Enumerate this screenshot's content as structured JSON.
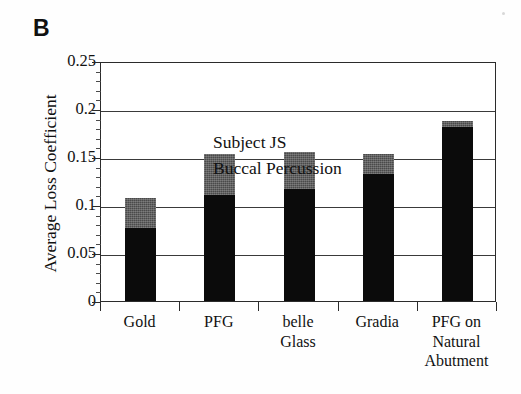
{
  "panel": {
    "letter": "B"
  },
  "annotation": {
    "lines": [
      "Subject JS",
      "Buccal Percussion"
    ]
  },
  "axes": {
    "ylabel": "Average Loss Coefficient",
    "yticks": [
      "0.25",
      "0.2",
      "0.15",
      "0.1",
      "0.05",
      "0"
    ],
    "xlabel": ""
  },
  "xlabels": [
    {
      "lines": [
        "Gold"
      ]
    },
    {
      "lines": [
        "PFG"
      ]
    },
    {
      "lines": [
        "belle",
        "Glass"
      ]
    },
    {
      "lines": [
        "Gradia"
      ]
    },
    {
      "lines": [
        "PFG on",
        "Natural",
        "Abutment"
      ]
    }
  ],
  "colors": {
    "lower_segment": "#0b0b0b",
    "upper_segment": "#4a4a4a",
    "axis": "#2b2b2b",
    "background": "#ffffff"
  },
  "chart_data": {
    "type": "bar",
    "title": "B",
    "subtitle": "Subject JS / Buccal Percussion",
    "xlabel": "",
    "ylabel": "Average Loss Coefficient",
    "ylim": [
      0,
      0.25
    ],
    "ytick_values": [
      0,
      0.05,
      0.1,
      0.15,
      0.2,
      0.25
    ],
    "grid": true,
    "grid_axis": "y",
    "legend": false,
    "stacked": true,
    "categories": [
      "Gold",
      "PFG",
      "belle Glass",
      "Gradia",
      "PFG on Natural Abutment"
    ],
    "series": [
      {
        "name": "lower (black)",
        "color": "#0b0b0b",
        "values": [
          0.076,
          0.11,
          0.117,
          0.132,
          0.181
        ]
      },
      {
        "name": "upper (gray)",
        "color": "#4a4a4a",
        "values": [
          0.031,
          0.043,
          0.038,
          0.021,
          0.007
        ]
      }
    ],
    "totals": [
      0.107,
      0.153,
      0.155,
      0.153,
      0.188
    ]
  }
}
